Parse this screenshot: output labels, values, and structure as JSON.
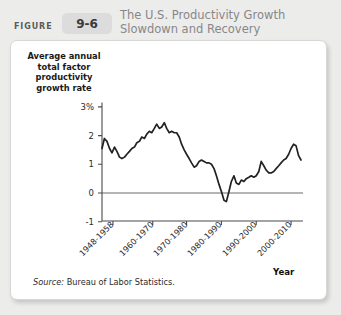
{
  "header": {
    "figure_word": "FIGURE",
    "figure_number": "9-6",
    "title_line1": "The U.S. Productivity Growth",
    "title_line2": "Slowdown and Recovery"
  },
  "source_note": {
    "prefix": "Source:",
    "text": " Bureau of Labor Statistics."
  },
  "chart_data": {
    "type": "line",
    "title": "The U.S. Productivity Growth Slowdown and Recovery",
    "xlabel": "Year",
    "ylabel": "Average annual total factor productivity growth rate",
    "ylabel_lines": [
      "Average annual",
      "total factor",
      "productivity",
      "growth rate"
    ],
    "ylim": [
      -1,
      3
    ],
    "yticks": [
      3,
      2,
      1,
      0,
      -1
    ],
    "ytick_labels": [
      "3%",
      "2",
      "1",
      "0",
      "-1"
    ],
    "grid": false,
    "zero_line": true,
    "legend": "none",
    "xtick_labels": [
      "1948-1958",
      "1960-1970",
      "1970-1980",
      "1980-1990",
      "1990-2000",
      "2000-2010"
    ],
    "xtick_positions": [
      0.055,
      0.255,
      0.425,
      0.6,
      0.775,
      0.95
    ],
    "line_color": "#222222",
    "series": [
      {
        "name": "Average annual total factor productivity growth rate",
        "x": [
          0.0,
          0.012,
          0.025,
          0.038,
          0.05,
          0.063,
          0.075,
          0.088,
          0.1,
          0.113,
          0.125,
          0.138,
          0.15,
          0.163,
          0.175,
          0.188,
          0.2,
          0.213,
          0.225,
          0.238,
          0.25,
          0.263,
          0.275,
          0.288,
          0.3,
          0.313,
          0.325,
          0.338,
          0.35,
          0.363,
          0.375,
          0.388,
          0.4,
          0.413,
          0.425,
          0.438,
          0.45,
          0.463,
          0.475,
          0.488,
          0.5,
          0.513,
          0.525,
          0.538,
          0.55,
          0.563,
          0.575,
          0.588,
          0.6,
          0.613,
          0.625,
          0.638,
          0.65,
          0.663,
          0.675,
          0.688,
          0.7,
          0.713,
          0.725,
          0.738,
          0.75,
          0.763,
          0.775,
          0.788,
          0.8,
          0.813,
          0.825,
          0.838,
          0.85,
          0.863,
          0.875,
          0.888,
          0.9,
          0.913,
          0.925,
          0.938,
          0.95,
          0.963,
          0.975,
          0.988,
          1.0
        ],
        "values": [
          1.55,
          1.9,
          1.8,
          1.55,
          1.4,
          1.6,
          1.45,
          1.25,
          1.2,
          1.25,
          1.35,
          1.45,
          1.55,
          1.6,
          1.75,
          1.8,
          1.95,
          1.9,
          2.05,
          2.15,
          2.1,
          2.25,
          2.4,
          2.25,
          2.3,
          2.45,
          2.25,
          2.1,
          2.15,
          2.1,
          2.1,
          1.95,
          1.7,
          1.5,
          1.35,
          1.2,
          1.05,
          0.9,
          0.95,
          1.1,
          1.15,
          1.1,
          1.05,
          1.05,
          1.0,
          0.85,
          0.6,
          0.3,
          0.05,
          -0.25,
          -0.3,
          0.05,
          0.4,
          0.6,
          0.35,
          0.3,
          0.45,
          0.4,
          0.5,
          0.55,
          0.6,
          0.55,
          0.6,
          0.75,
          1.1,
          0.95,
          0.8,
          0.7,
          0.7,
          0.75,
          0.85,
          0.95,
          1.05,
          1.15,
          1.2,
          1.35,
          1.55,
          1.7,
          1.65,
          1.3,
          1.15
        ]
      }
    ],
    "axes_geometry": {
      "left": 101,
      "right": 300,
      "top": 100,
      "bottom": 220,
      "y_zero_px": 192,
      "px_per_unit": 28.7
    }
  }
}
